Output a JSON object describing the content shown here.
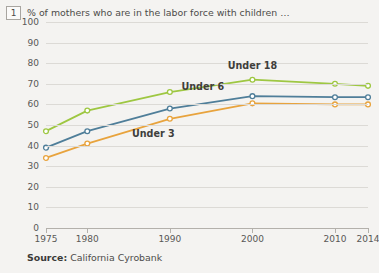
{
  "annotation": {
    "number": "1"
  },
  "headline": "% of mothers who are in the labor force with children …",
  "source": {
    "label": "Source:",
    "text": "California Cyrobank"
  },
  "footer_icon": "note-number-icon",
  "colors": {
    "under_18": "#9ec742",
    "under_6": "#4f7e99",
    "under_3": "#e8a33d",
    "grid": "#dcdad6",
    "axis": "#b3b0ab",
    "background": "#f4f3f1",
    "text": "#4d4c4a"
  },
  "chart_data": {
    "type": "line",
    "title": "% of mothers who are in the labor force with children …",
    "xlabel": "",
    "ylabel": "",
    "x": [
      1975,
      1980,
      1990,
      2000,
      2010,
      2014
    ],
    "xticklabels": [
      "1975",
      "1980",
      "1990",
      "2000",
      "2010",
      "2014"
    ],
    "yticks": [
      0,
      10,
      20,
      30,
      40,
      50,
      60,
      70,
      80,
      90,
      100
    ],
    "yticklabels": [
      "0",
      "10",
      "20",
      "30",
      "40",
      "50",
      "60",
      "70",
      "80",
      "90",
      "100"
    ],
    "ylim": [
      0,
      100
    ],
    "xlim": [
      1975,
      2014
    ],
    "grid": "horizontal",
    "legend": "inline-labels",
    "markers": "open-circle",
    "series": [
      {
        "name": "Under 18",
        "color": "#9ec742",
        "values": [
          47,
          57,
          66,
          72,
          70,
          69
        ],
        "label_x": 2000,
        "label_y": 79
      },
      {
        "name": "Under 6",
        "color": "#4f7e99",
        "values": [
          39,
          47,
          58,
          64,
          63.5,
          63.5
        ],
        "label_x": 1994,
        "label_y": 69
      },
      {
        "name": "Under 3",
        "color": "#e8a33d",
        "values": [
          34,
          41,
          53,
          60.5,
          60,
          60
        ],
        "label_x": 1988,
        "label_y": 46
      }
    ]
  }
}
